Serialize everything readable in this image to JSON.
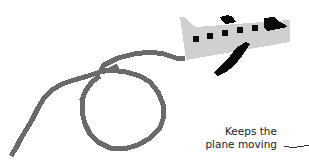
{
  "annotation": {
    "line1": "Keeps the",
    "line2": "plane moving"
  },
  "colors": {
    "plane_body": "#d0d0d0",
    "plane_dark": "#0a0a0a",
    "trail": "#6a6a6a",
    "text": "#222222"
  },
  "illustration": {
    "subject": "pixel-art airplane with looping smoke trail"
  }
}
